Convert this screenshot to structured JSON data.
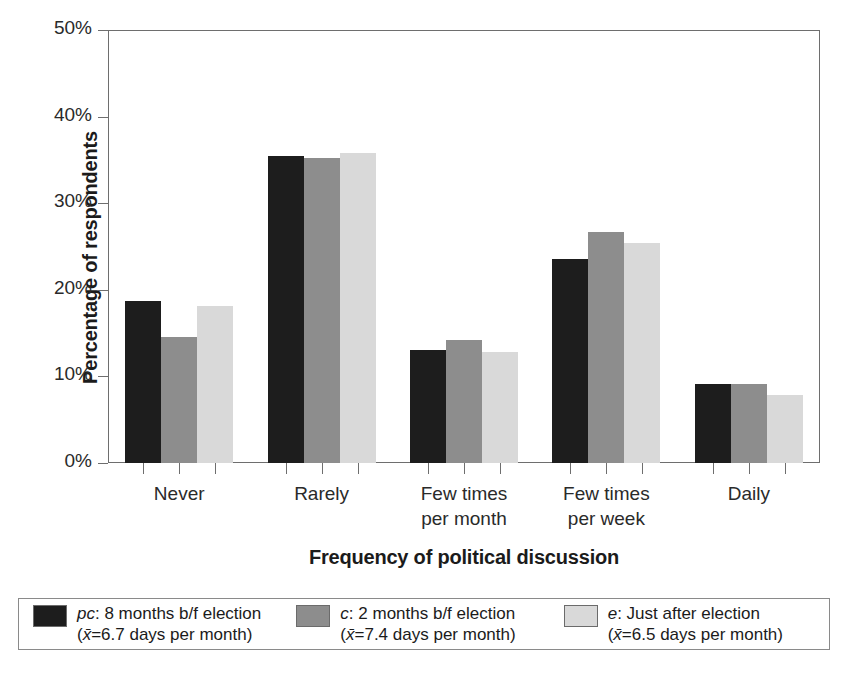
{
  "chart_data": {
    "type": "bar",
    "title": "",
    "xlabel": "Frequency of political discussion",
    "ylabel": "Percentage of respondents",
    "categories": [
      "Never",
      "Rarely",
      "Few times\nper month",
      "Few times\nper week",
      "Daily"
    ],
    "ylim": [
      0,
      50
    ],
    "ytick_labels": [
      "0%",
      "10%",
      "20%",
      "30%",
      "40%",
      "50%"
    ],
    "ytick_values": [
      0,
      10,
      20,
      30,
      40,
      50
    ],
    "yunit": "%",
    "grid": false,
    "legend_position": "bottom",
    "series": [
      {
        "name": "pc: 8 months b/f election",
        "color": "#1d1d1d",
        "values": [
          18.7,
          35.5,
          13.0,
          23.6,
          9.1
        ]
      },
      {
        "name": "c: 2 months b/f election",
        "color": "#8d8d8d",
        "values": [
          14.5,
          35.2,
          14.2,
          26.7,
          9.1
        ]
      },
      {
        "name": "e: Just after election",
        "color": "#d9d9d9",
        "values": [
          18.1,
          35.8,
          12.8,
          25.4,
          7.8
        ]
      }
    ]
  },
  "legend": {
    "entries": [
      {
        "code": "pc",
        "line1": ": 8 months b/f election",
        "xbar": "x̄",
        "line2": "=6.7 days per month",
        "mean_value": "6.7",
        "mean_unit": "days per month",
        "color": "#1d1d1d"
      },
      {
        "code": "c",
        "line1": ": 2 months b/f election",
        "xbar": "x̄",
        "line2": "=7.4 days per month",
        "mean_value": "7.4",
        "mean_unit": "days per month",
        "color": "#8d8d8d"
      },
      {
        "code": "e",
        "line1": ": Just after election",
        "xbar": "x̄",
        "line2": "=6.5 days per month",
        "mean_value": "6.5",
        "mean_unit": "days per month",
        "color": "#d9d9d9"
      }
    ]
  },
  "axes": {
    "frame_color": "#6e6e6e",
    "tick_color": "#6e6e6e",
    "text_color": "#1b1b1b"
  }
}
